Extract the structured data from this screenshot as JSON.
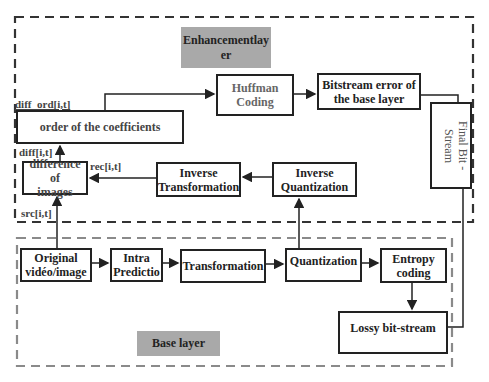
{
  "diagram": {
    "enhancement_layer": {
      "label": "Enhancementlay er",
      "label_line1": "Enhancementlay",
      "label_line2": "er"
    },
    "base_layer": {
      "label": "Base layer"
    },
    "blocks": {
      "huffman_coding": {
        "line1": "Huffman",
        "line2": "Coding"
      },
      "bitstream_error": {
        "line1": "Bitstream error of",
        "line2": "the base layer"
      },
      "final_bitstream": {
        "text": "Final Bit - Stream"
      },
      "order_coefficients": {
        "text": "order of the coefficients"
      },
      "difference_images": {
        "line1": "difference of",
        "line2": "images"
      },
      "inverse_transformation": {
        "line1": "Inverse",
        "line2": "Transformation"
      },
      "inverse_quantization": {
        "line1": "Inverse",
        "line2": "Quantization"
      },
      "original_video": {
        "line1": "Original",
        "line2": "vidéo/image"
      },
      "intra_prediction": {
        "line1": "Intra",
        "line2": "Predictio"
      },
      "transformation": {
        "text": "Transformation"
      },
      "quantization": {
        "text": "Quantization"
      },
      "entropy_coding": {
        "line1": "Entropy",
        "line2": "coding"
      },
      "lossy_bitstream": {
        "text": "Lossy bit-stream"
      }
    },
    "signals": {
      "diff_ord": "diff_ord[i,t]",
      "diff": "diff[i,t]",
      "rec": "rec[i,t]",
      "src": "src[i,t]"
    },
    "colors": {
      "enhancement_border": "#333333",
      "base_border": "#888888",
      "label_fill": "#a9a9a9",
      "stroke": "#222222"
    }
  }
}
